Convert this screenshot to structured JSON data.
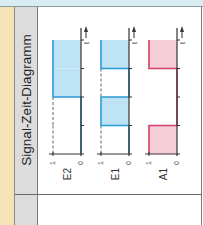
{
  "header": {
    "title": "Signal-Zeit-Diagramm"
  },
  "colors": {
    "input_fill": "#bde3f4",
    "input_stroke": "#2a9bd4",
    "output_fill": "#f4cdd8",
    "output_stroke": "#d04068",
    "axis": "#333333",
    "title_column_bg": "#dcdcdc",
    "left_strip_bg": "#f5e3b8",
    "top_strip_bg": "#d9ecf2"
  },
  "diagram": {
    "orientation": "rotated-90-ccw",
    "time_axis_label": "t",
    "level_labels": {
      "high": "1",
      "low": "0"
    },
    "time_ticks": 4,
    "signals": [
      {
        "name": "E2",
        "type": "input",
        "segments": [
          0,
          0,
          1,
          1
        ]
      },
      {
        "name": "E1",
        "type": "input",
        "segments": [
          0,
          1,
          0,
          1
        ]
      },
      {
        "name": "A1",
        "type": "output",
        "segments": [
          1,
          0,
          0,
          1
        ]
      }
    ]
  }
}
